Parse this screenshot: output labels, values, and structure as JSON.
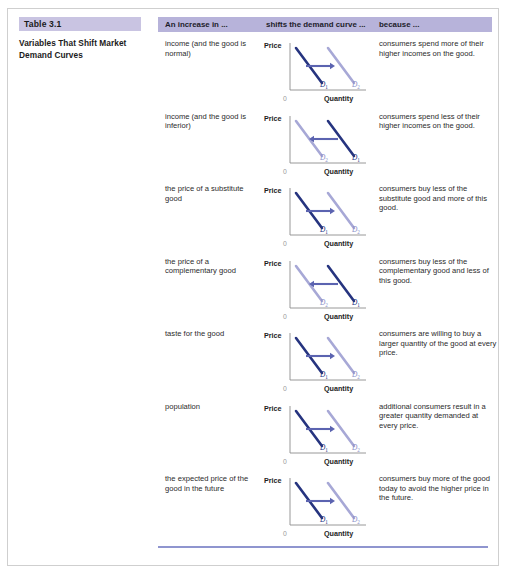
{
  "figure": {
    "table_number": "Table 3.1",
    "table_title": "Variables That Shift Market Demand Curves"
  },
  "header": {
    "col1": "An increase in ...",
    "col2": "shifts the demand curve ...",
    "col3": "because ..."
  },
  "chart_labels": {
    "price": "Price",
    "quantity": "Quantity",
    "origin": "0",
    "d1": "D",
    "d1_sub": "1",
    "d2": "D",
    "d2_sub": "2"
  },
  "colors": {
    "header_band": "#b7b3da",
    "title_band": "#c9c4e2",
    "curve_initial": "#26347f",
    "curve_shifted": "#a7a8d6",
    "arrow": "#5b63b0",
    "bottom_rule": "#8f95cf"
  },
  "rows": [
    {
      "variable": "income (and the good is normal)",
      "direction": "right",
      "because": "consumers spend more of their higher incomes on the good."
    },
    {
      "variable": "income (and the good is inferior)",
      "direction": "left",
      "because": "consumers spend less of their higher incomes on the good."
    },
    {
      "variable": "the price of a substitute good",
      "direction": "right",
      "because": "consumers buy less of the substitute good and more of this good."
    },
    {
      "variable": "the price of a complementary good",
      "direction": "left",
      "because": "consumers buy less of the complementary good and less of this good."
    },
    {
      "variable": "taste for the good",
      "direction": "right",
      "because": "consumers are willing to buy a larger quantity of the good at every price."
    },
    {
      "variable": "population",
      "direction": "right",
      "because": "additional consumers result in a greater quantity demanded at every price."
    },
    {
      "variable": "the expected price of the good in the future",
      "direction": "right",
      "because": "consumers buy more of the good today to avoid the higher price in the future."
    }
  ],
  "chart_data": {
    "type": "line",
    "xlabel": "Quantity",
    "ylabel": "Price",
    "grid": false,
    "legend": "inline-curve-labels",
    "panels": [
      {
        "id": 1,
        "direction": "right",
        "initial_curve": "D1",
        "shifted_curve": "D2",
        "initial_position": "left",
        "shifted_position": "right"
      },
      {
        "id": 2,
        "direction": "left",
        "initial_curve": "D1",
        "shifted_curve": "D2",
        "initial_position": "right",
        "shifted_position": "left"
      },
      {
        "id": 3,
        "direction": "right",
        "initial_curve": "D1",
        "shifted_curve": "D2",
        "initial_position": "left",
        "shifted_position": "right"
      },
      {
        "id": 4,
        "direction": "left",
        "initial_curve": "D1",
        "shifted_curve": "D2",
        "initial_position": "right",
        "shifted_position": "left"
      },
      {
        "id": 5,
        "direction": "right",
        "initial_curve": "D1",
        "shifted_curve": "D2",
        "initial_position": "left",
        "shifted_position": "right"
      },
      {
        "id": 6,
        "direction": "right",
        "initial_curve": "D1",
        "shifted_curve": "D2",
        "initial_position": "left",
        "shifted_position": "right"
      },
      {
        "id": 7,
        "direction": "right",
        "initial_curve": "D1",
        "shifted_curve": "D2",
        "initial_position": "left",
        "shifted_position": "right"
      }
    ]
  }
}
